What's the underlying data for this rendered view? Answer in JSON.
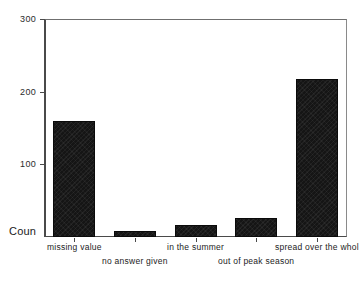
{
  "chart_data": {
    "type": "bar",
    "title": "",
    "subtitle": "",
    "xlabel": "",
    "ylabel": "Coun",
    "ylabel_full": "Count",
    "categories": [
      "missing value",
      "no answer given",
      "in the summer",
      "out of peak season",
      "spread over the whol"
    ],
    "values": [
      160,
      8,
      17,
      26,
      217
    ],
    "ylim": [
      0,
      300
    ],
    "ytick_labels": [
      "300",
      "200",
      "100"
    ],
    "ytick_values": [
      300,
      200,
      100
    ],
    "grid": false,
    "legend": false,
    "legend_position": "none",
    "bar_color": "#151515",
    "axis_color": "#4a4a4a",
    "background_color": "#ffffff"
  },
  "axes": {
    "y_title": "Coun",
    "y_ticks": [
      {
        "label": "300",
        "value": 300
      },
      {
        "label": "200",
        "value": 200
      },
      {
        "label": "100",
        "value": 100
      }
    ]
  },
  "x_labels": [
    {
      "text": "missing value",
      "row": 0
    },
    {
      "text": "no answer given",
      "row": 1
    },
    {
      "text": "in the summer",
      "row": 0
    },
    {
      "text": "out of peak season",
      "row": 1
    },
    {
      "text": "spread over the whol",
      "row": 0
    }
  ]
}
